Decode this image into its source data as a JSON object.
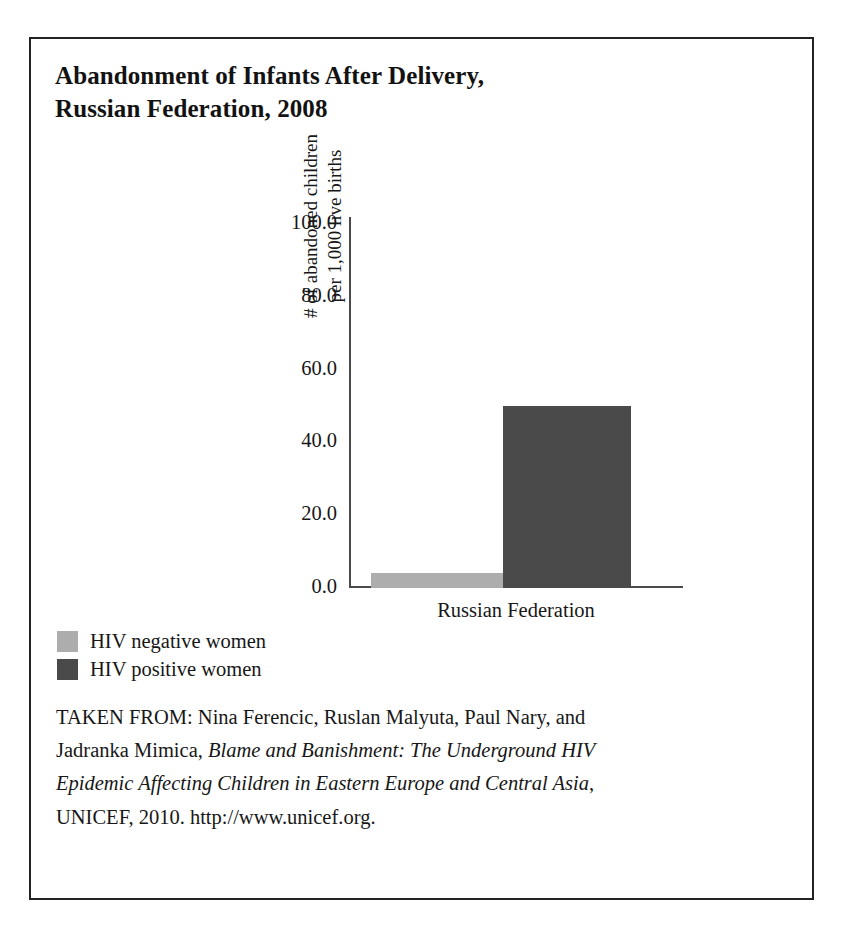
{
  "figure": {
    "title_lines": [
      "Abandonment of Infants After Delivery,",
      "Russian Federation, 2008"
    ],
    "border_color": "#222222",
    "background": "#ffffff"
  },
  "chart_data": {
    "type": "bar",
    "title": "Abandonment of Infants After Delivery, Russian Federation, 2008",
    "categories": [
      "Russian Federation"
    ],
    "series": [
      {
        "name": "HIV negative women",
        "values": [
          4.0
        ],
        "color": "#adadad"
      },
      {
        "name": "HIV positive women",
        "values": [
          50.0
        ],
        "color": "#4a4a4a"
      }
    ],
    "xlabel": "",
    "ylabel": "# of abandoned children per 1,000 live births",
    "ylabel_lines": [
      "# of abandoned children",
      "per 1,000 live births"
    ],
    "ylim": [
      0.0,
      100.0
    ],
    "ytick_labels": [
      "100.0",
      "80.0",
      "60.0",
      "40.0",
      "20.0",
      "0.0"
    ],
    "ytick_values": [
      100.0,
      80.0,
      60.0,
      40.0,
      20.0,
      0.0
    ],
    "grid": false,
    "legend_position": "below-left"
  },
  "legend": {
    "entries": [
      {
        "label": "HIV negative women",
        "color": "#adadad"
      },
      {
        "label": "HIV positive women",
        "color": "#4a4a4a"
      }
    ]
  },
  "source_note": {
    "line1": "TAKEN FROM: Nina Ferencic, Ruslan Malyuta, Paul Nary, and",
    "line2_plain": "Jadranka Mimica, ",
    "line2_italic": "Blame and Banishment: The Underground HIV",
    "line3_italic": "Epidemic Affecting Children in Eastern Europe and Central Asia",
    "line3_plain": ",",
    "line4": "UNICEF, 2010. http://www.unicef.org."
  }
}
